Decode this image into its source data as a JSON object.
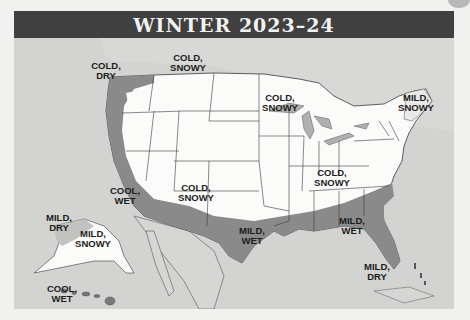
{
  "title": "WINTER 2023–24",
  "colors": {
    "title_bar": "#404040",
    "background": "#d3d3d1",
    "land": "#fbfbfa",
    "mild_wet_region": "#8a8a8a",
    "border_lines": "#3a3a3a"
  },
  "regions": [
    {
      "id": "pacific-northwest",
      "label_line1": "COLD,",
      "label_line2": "DRY"
    },
    {
      "id": "northern-rockies",
      "label_line1": "COLD,",
      "label_line2": "SNOWY"
    },
    {
      "id": "upper-midwest",
      "label_line1": "COLD,",
      "label_line2": "SNOWY"
    },
    {
      "id": "northeast",
      "label_line1": "MILD,",
      "label_line2": "SNOWY"
    },
    {
      "id": "california",
      "label_line1": "COOL,",
      "label_line2": "WET"
    },
    {
      "id": "southwest",
      "label_line1": "COLD,",
      "label_line2": "SNOWY"
    },
    {
      "id": "ohio-valley",
      "label_line1": "COLD,",
      "label_line2": "SNOWY"
    },
    {
      "id": "texas",
      "label_line1": "MILD,",
      "label_line2": "WET"
    },
    {
      "id": "southeast",
      "label_line1": "MILD,",
      "label_line2": "WET"
    },
    {
      "id": "florida",
      "label_line1": "MILD,",
      "label_line2": "DRY"
    },
    {
      "id": "alaska-west",
      "label_line1": "MILD,",
      "label_line2": "DRY"
    },
    {
      "id": "alaska-east",
      "label_line1": "MILD,",
      "label_line2": "SNOWY"
    },
    {
      "id": "hawaii",
      "label_line1": "COOL,",
      "label_line2": "WET"
    }
  ]
}
